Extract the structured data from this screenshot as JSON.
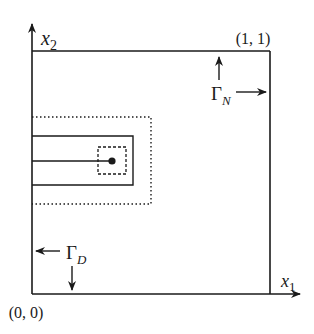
{
  "diagram": {
    "axes": {
      "x_label": "x",
      "x_sub": "1",
      "y_label": "x",
      "y_sub": "2"
    },
    "corners": {
      "origin": "(0, 0)",
      "top_right": "(1, 1)"
    },
    "boundaries": {
      "neumann": {
        "symbol": "Γ",
        "sub": "N"
      },
      "dirichlet": {
        "symbol": "Γ",
        "sub": "D"
      }
    },
    "colors": {
      "stroke": "#1a1a1a",
      "background": "#ffffff"
    }
  }
}
